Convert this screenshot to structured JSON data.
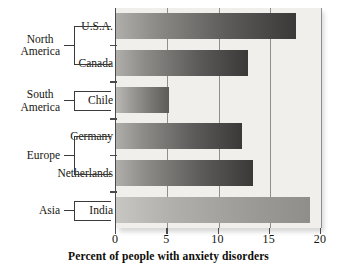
{
  "chart_data": {
    "type": "bar",
    "orientation": "horizontal",
    "title": "",
    "xlabel": "Percent of people with anxiety disorders",
    "ylabel": "",
    "xlim": [
      0,
      20
    ],
    "xticks": [
      "0",
      "5",
      "10",
      "15",
      "20"
    ],
    "grid": true,
    "legend": null,
    "categories": [
      "U.S.A.",
      "Canada",
      "Chile",
      "Germany",
      "Netherlands",
      "India"
    ],
    "values": [
      17.6,
      12.9,
      5.2,
      12.3,
      13.4,
      18.9
    ],
    "groups": [
      {
        "label": "North\nAmerica",
        "members": [
          "U.S.A.",
          "Canada"
        ]
      },
      {
        "label": "South\nAmerica",
        "members": [
          "Chile"
        ]
      },
      {
        "label": "Europe",
        "members": [
          "Germany",
          "Netherlands"
        ]
      },
      {
        "label": "Asia",
        "members": [
          "India"
        ]
      }
    ]
  },
  "axis": {
    "title": "Percent of people with anxiety disorders",
    "ticks": [
      {
        "label": "0",
        "value": 0
      },
      {
        "label": "5",
        "value": 5
      },
      {
        "label": "10",
        "value": 10
      },
      {
        "label": "15",
        "value": 15
      },
      {
        "label": "20",
        "value": 20
      }
    ]
  },
  "bars": [
    {
      "country": "U.S.A.",
      "value": 17.6,
      "style": "dark"
    },
    {
      "country": "Canada",
      "value": 12.9,
      "style": "dark"
    },
    {
      "country": "Chile",
      "value": 5.2,
      "style": "mid"
    },
    {
      "country": "Germany",
      "value": 12.3,
      "style": "dark"
    },
    {
      "country": "Netherlands",
      "value": 13.4,
      "style": "dark"
    },
    {
      "country": "India",
      "value": 18.9,
      "style": "light"
    }
  ],
  "regions": [
    {
      "line1": "North",
      "line2": "America"
    },
    {
      "line1": "South",
      "line2": "America"
    },
    {
      "line1": "Europe",
      "line2": ""
    },
    {
      "line1": "Asia",
      "line2": ""
    }
  ],
  "colors": {
    "plot_background": "#f0efec",
    "axis": "#4a4a4a",
    "gridline": "#8e8e8e",
    "text": "#16160f",
    "bar_dark_start": "#b0aeab",
    "bar_dark_end": "#3a3937",
    "bar_light_start": "#c8c6c3",
    "bar_light_end": "#908e8b"
  }
}
